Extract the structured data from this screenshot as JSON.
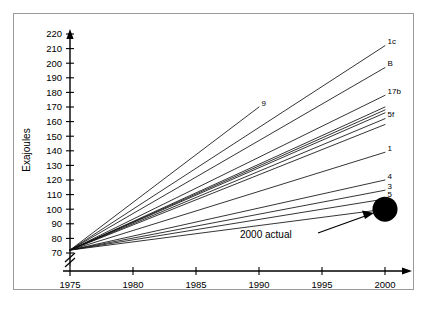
{
  "chart_data": {
    "type": "line",
    "title": "",
    "subtitle": "",
    "xlabel": "",
    "ylabel": "Exajoules",
    "xlim": [
      1975,
      2000
    ],
    "ylim": [
      70,
      220
    ],
    "grid": false,
    "legend_position": "inline-right-endpoint-labels",
    "x_ticks": [
      1975,
      1980,
      1985,
      1990,
      1995,
      2000
    ],
    "x_tick_labels": [
      "1975",
      "1980",
      "1985",
      "1990",
      "1995",
      "2000"
    ],
    "y_ticks": [
      70,
      80,
      90,
      100,
      110,
      120,
      130,
      140,
      150,
      160,
      170,
      180,
      190,
      200,
      210,
      220
    ],
    "y_tick_labels": [
      "70",
      "80",
      "90",
      "100",
      "110",
      "120",
      "130",
      "140",
      "150",
      "160",
      "170",
      "180",
      "190",
      "200",
      "210",
      "220"
    ],
    "y_axis_break": true,
    "origin_point": {
      "x": 1975,
      "y": 72
    },
    "series": [
      {
        "name": "1c",
        "label": "1c",
        "x": [
          1975,
          2000
        ],
        "values": [
          72,
          212
        ]
      },
      {
        "name": "B",
        "label": "B",
        "x": [
          1975,
          2000
        ],
        "values": [
          72,
          197
        ]
      },
      {
        "name": "9",
        "label": "9",
        "x": [
          1975,
          1990
        ],
        "values": [
          72,
          170
        ]
      },
      {
        "name": "17b",
        "label": "17b",
        "x": [
          1975,
          2000
        ],
        "values": [
          72,
          178
        ]
      },
      {
        "name": "u1",
        "label": "",
        "x": [
          1975,
          2000
        ],
        "values": [
          72,
          170
        ]
      },
      {
        "name": "u2",
        "label": "",
        "x": [
          1975,
          2000
        ],
        "values": [
          72,
          168
        ]
      },
      {
        "name": "u3",
        "label": "",
        "x": [
          1975,
          2000
        ],
        "values": [
          72,
          166
        ]
      },
      {
        "name": "5f",
        "label": "5f",
        "x": [
          1975,
          2000
        ],
        "values": [
          72,
          162
        ]
      },
      {
        "name": "u4",
        "label": "",
        "x": [
          1975,
          2000
        ],
        "values": [
          72,
          158
        ]
      },
      {
        "name": "1",
        "label": "1",
        "x": [
          1975,
          2000
        ],
        "values": [
          72,
          139
        ]
      },
      {
        "name": "4",
        "label": "4",
        "x": [
          1975,
          2000
        ],
        "values": [
          72,
          120
        ]
      },
      {
        "name": "3",
        "label": "3",
        "x": [
          1975,
          2000
        ],
        "values": [
          72,
          113
        ]
      },
      {
        "name": "5",
        "label": "5",
        "x": [
          1975,
          2000
        ],
        "values": [
          72,
          107
        ]
      },
      {
        "name": "1m",
        "label": "1",
        "x": [
          1975,
          2000
        ],
        "values": [
          72,
          100
        ]
      }
    ],
    "actual_point": {
      "label": "2000 actual",
      "x": 2000,
      "y": 100,
      "marker": "filled-circle",
      "color": "#000000"
    },
    "annotations": [
      {
        "name": "2000-actual-annotation",
        "text": "2000 actual",
        "points_to": [
          2000,
          100
        ]
      }
    ]
  }
}
